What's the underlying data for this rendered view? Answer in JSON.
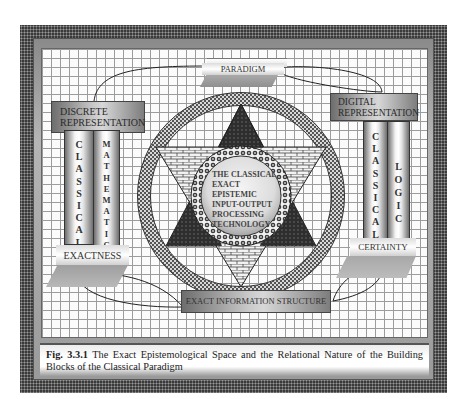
{
  "figure": {
    "caption_label": "Fig. 3.3.1",
    "caption_text": " The Exact Epistemological Space and the Relational Nature of the Building Blocks of the Classical Paradigm"
  },
  "diagram": {
    "top_banner": "PARADIGM",
    "left_header": "DISCRETE REPRESENTATION",
    "left_columns": [
      "CLASSICAL",
      "MATHEMATICS"
    ],
    "left_base": "EXACTNESS",
    "right_header": "DIGITAL REPRESENTATION",
    "right_columns": [
      "CLASSICAL",
      "LOGIC"
    ],
    "right_base": "CERTAINTY",
    "bottom_bar": "EXACT INFORMATION STRUCTURE",
    "center_lines": [
      "THE CLASSICAL",
      "EXACT",
      "EPISTEMIC",
      "INPUT-OUTPUT",
      "PROCESSING",
      "TECHNOLOGY"
    ]
  },
  "colors": {
    "frame": "#3a3a3a",
    "grid_line": "#9c9c9c",
    "dark_triangle": "#2b2b2b",
    "text": "#333333"
  }
}
